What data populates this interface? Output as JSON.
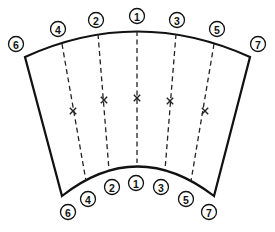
{
  "diagram": {
    "colors": {
      "line": "#111111",
      "background": "#ffffff"
    },
    "top_labels": [
      {
        "id": "6",
        "text": "6",
        "x": 16,
        "y": 44
      },
      {
        "id": "4",
        "text": "4",
        "x": 58,
        "y": 29
      },
      {
        "id": "2",
        "text": "2",
        "x": 96,
        "y": 20
      },
      {
        "id": "1",
        "text": "1",
        "x": 137,
        "y": 16
      },
      {
        "id": "3",
        "text": "3",
        "x": 177,
        "y": 20
      },
      {
        "id": "5",
        "text": "5",
        "x": 217,
        "y": 29
      },
      {
        "id": "7",
        "text": "7",
        "x": 258,
        "y": 44
      }
    ],
    "bottom_labels": [
      {
        "id": "6",
        "text": "6",
        "x": 68,
        "y": 212
      },
      {
        "id": "4",
        "text": "4",
        "x": 88,
        "y": 199
      },
      {
        "id": "2",
        "text": "2",
        "x": 112,
        "y": 187
      },
      {
        "id": "1",
        "text": "1",
        "x": 136,
        "y": 183
      },
      {
        "id": "3",
        "text": "3",
        "x": 161,
        "y": 187
      },
      {
        "id": "5",
        "text": "5",
        "x": 186,
        "y": 199
      },
      {
        "id": "7",
        "text": "7",
        "x": 209,
        "y": 212
      }
    ],
    "center_marks": [
      {
        "symbol": "×",
        "x": 73,
        "y": 111
      },
      {
        "symbol": "×",
        "x": 104,
        "y": 100
      },
      {
        "symbol": "×",
        "x": 137,
        "y": 98
      },
      {
        "symbol": "×",
        "x": 170,
        "y": 101
      },
      {
        "symbol": "×",
        "x": 205,
        "y": 111
      }
    ]
  }
}
